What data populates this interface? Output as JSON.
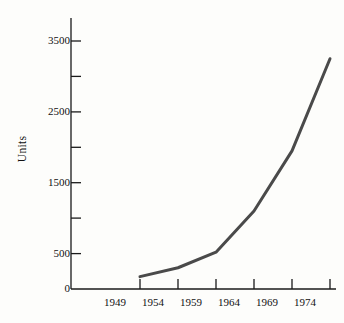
{
  "figure": {
    "background_color": "#fdfdfb",
    "axis_color": "#1a1a1a",
    "line_color": "#4a4a4a",
    "text_color": "#111111"
  },
  "axes": {
    "ylabel": "Units",
    "xlabel": "",
    "y_tick_labels": [
      "0",
      "500",
      "1500",
      "2500",
      "3500"
    ],
    "y_minor_ticks": [
      "1000",
      "2000",
      "3000"
    ],
    "x_tick_labels": [
      "1949",
      "1954",
      "1959",
      "1964",
      "1969",
      "1974"
    ]
  },
  "chart_data": {
    "type": "line",
    "title": "",
    "xlabel": "",
    "ylabel": "Units",
    "x": [
      1949,
      1954,
      1959,
      1964,
      1969,
      1974
    ],
    "categories": [
      "1949",
      "1954",
      "1959",
      "1964",
      "1969",
      "1974"
    ],
    "values": [
      175,
      300,
      520,
      1100,
      1950,
      3250
    ],
    "series": [
      {
        "name": "Units",
        "values": [
          175,
          300,
          520,
          1100,
          1950,
          3250
        ]
      }
    ],
    "xlim": [
      1949,
      1974
    ],
    "ylim": [
      0,
      3500
    ],
    "yticks": [
      0,
      500,
      1000,
      1500,
      2000,
      2500,
      3000,
      3500
    ],
    "ytick_labels_shown": [
      0,
      500,
      1500,
      2500,
      3500
    ],
    "xticks": [
      1949,
      1954,
      1959,
      1964,
      1969,
      1974
    ],
    "grid": false,
    "legend": false,
    "markers": false,
    "line_width": 3
  }
}
